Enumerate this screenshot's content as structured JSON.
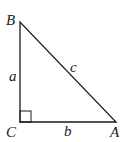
{
  "diagram": {
    "type": "right-triangle",
    "vertices": {
      "B": {
        "label": "B",
        "x": 20,
        "y": 22
      },
      "C": {
        "label": "C",
        "x": 20,
        "y": 122
      },
      "A": {
        "label": "A",
        "x": 116,
        "y": 122
      }
    },
    "sides": {
      "a": {
        "label": "a"
      },
      "b": {
        "label": "b"
      },
      "c": {
        "label": "c"
      }
    },
    "right_angle_at": "C",
    "stroke_color": "#1a1a1a"
  }
}
